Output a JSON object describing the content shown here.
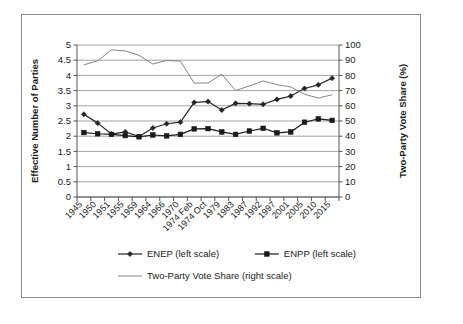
{
  "chart_data": {
    "type": "line",
    "title": "",
    "xlabel": "",
    "ylabel": "Effective Number of Parties",
    "y2label": "Two-Party Vote Share (%)",
    "ylim": [
      0,
      5
    ],
    "y2lim": [
      0,
      100
    ],
    "yticks": [
      0,
      0.5,
      1,
      1.5,
      2,
      2.5,
      3,
      3.5,
      4,
      4.5,
      5
    ],
    "ytick_labels": [
      "0",
      "0.5",
      "1",
      "1.5",
      "2",
      "2.5",
      "3",
      "3.5",
      "4",
      "4.5",
      "5"
    ],
    "y2ticks": [
      0,
      10,
      20,
      30,
      40,
      50,
      60,
      70,
      80,
      90,
      100
    ],
    "y2tick_labels": [
      "0",
      "10",
      "20",
      "30",
      "40",
      "50",
      "60",
      "70",
      "80",
      "90",
      "100"
    ],
    "grid": true,
    "grid_axis": "y",
    "legend_position": "bottom",
    "categories": [
      "1945",
      "1950",
      "1951",
      "1955",
      "1959",
      "1964",
      "1966",
      "1970",
      "1974 Feb",
      "1974 Oct",
      "1979",
      "1983",
      "1987",
      "1992",
      "1997",
      "2001",
      "2005",
      "2010",
      "2015"
    ],
    "series": [
      {
        "name": "ENEP (left scale)",
        "axis": "left",
        "marker": "diamond",
        "color": "#262626",
        "values": [
          2.72,
          2.43,
          2.07,
          2.14,
          1.99,
          2.27,
          2.41,
          2.46,
          3.11,
          3.14,
          2.86,
          3.08,
          3.07,
          3.05,
          3.21,
          3.32,
          3.57,
          3.69,
          3.91
        ]
      },
      {
        "name": "ENPP (left scale)",
        "axis": "left",
        "marker": "square",
        "color": "#1a1a1a",
        "values": [
          2.12,
          2.08,
          2.06,
          2.02,
          1.98,
          2.04,
          2.01,
          2.06,
          2.24,
          2.25,
          2.14,
          2.06,
          2.17,
          2.26,
          2.11,
          2.14,
          2.46,
          2.57,
          2.52
        ]
      },
      {
        "name": "Two-Party Vote Share (right scale)",
        "axis": "right",
        "marker": "none",
        "color": "#777777",
        "values": [
          87.0,
          89.6,
          96.8,
          96.1,
          93.2,
          87.5,
          89.8,
          89.4,
          74.9,
          75.0,
          80.8,
          70.0,
          73.1,
          76.3,
          73.9,
          72.4,
          67.6,
          65.1,
          67.2
        ]
      }
    ]
  },
  "axis_titles": {
    "left": "Effective Number of Parties",
    "right": "Two-Party Vote Share (%)"
  },
  "legend": {
    "items": [
      {
        "label": "ENEP (left scale)",
        "marker": "diamond",
        "color": "#262626"
      },
      {
        "label": "ENPP (left scale)",
        "marker": "square",
        "color": "#1a1a1a"
      },
      {
        "label": "Two-Party Vote Share (right scale)",
        "marker": "none",
        "color": "#777777"
      }
    ]
  },
  "colors": {
    "frame": "#8a8a8a",
    "axis": "#555555",
    "grid": "#8c8c8c",
    "background": "#ffffff",
    "text": "#1a1a1a"
  }
}
